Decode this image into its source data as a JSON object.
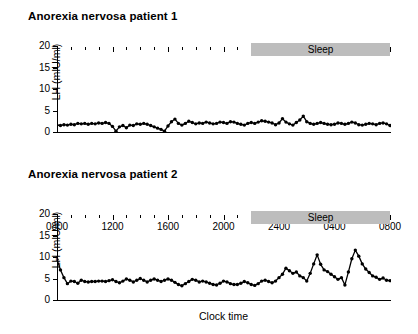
{
  "figure": {
    "x_axis_title": "Clock time",
    "y_axis_title": "LH (mIU/ml)",
    "sleep_label": "Sleep"
  },
  "panels": [
    {
      "title": "Anorexia nervosa patient 1"
    },
    {
      "title": "Anorexia nervosa patient 2"
    }
  ],
  "chart_data": {
    "type": "line",
    "xlabel": "Clock time",
    "ylabel": "LH (mIU/ml)",
    "ylim": [
      0,
      20
    ],
    "yticks": [
      0,
      5,
      10,
      15,
      20
    ],
    "ytick_labels": [
      "0",
      "5",
      "10",
      "15",
      "20"
    ],
    "xlim_hours": [
      8,
      32
    ],
    "xtick_labels": [
      "0800",
      "1200",
      "1600",
      "2000",
      "2400",
      "0400",
      "0800"
    ],
    "xtick_hours": [
      8,
      12,
      16,
      20,
      24,
      28,
      32
    ],
    "minor_tick_interval_hours": 1,
    "grid": false,
    "legend": false,
    "annotations": [
      {
        "text": "Sleep",
        "type": "span-bar",
        "start_hour": 22,
        "end_hour": 32,
        "color": "#bdbdbd",
        "panels": [
          0,
          1
        ]
      }
    ],
    "marker": "filled-circle",
    "sampling_interval_minutes": 15,
    "series": [
      {
        "name": "Anorexia nervosa patient 1",
        "panel": 0,
        "x_hours": [
          8,
          8.25,
          8.5,
          8.75,
          9,
          9.25,
          9.5,
          9.75,
          10,
          10.25,
          10.5,
          10.75,
          11,
          11.25,
          11.5,
          11.75,
          12,
          12.25,
          12.5,
          12.75,
          13,
          13.25,
          13.5,
          13.75,
          14,
          14.25,
          14.5,
          14.75,
          15,
          15.25,
          15.5,
          15.75,
          16,
          16.25,
          16.5,
          16.75,
          17,
          17.25,
          17.5,
          17.75,
          18,
          18.25,
          18.5,
          18.75,
          19,
          19.25,
          19.5,
          19.75,
          20,
          20.25,
          20.5,
          20.75,
          21,
          21.25,
          21.5,
          21.75,
          22,
          22.25,
          22.5,
          22.75,
          23,
          23.25,
          23.5,
          23.75,
          24,
          24.25,
          24.5,
          24.75,
          25,
          25.25,
          25.5,
          25.75,
          26,
          26.25,
          26.5,
          26.75,
          27,
          27.25,
          27.5,
          27.75,
          28,
          28.25,
          28.5,
          28.75,
          29,
          29.25,
          29.5,
          29.75,
          30,
          30.25,
          30.5,
          30.75,
          31,
          31.25,
          31.5,
          31.75,
          32
        ],
        "values": [
          1.6,
          1.5,
          1.7,
          1.6,
          1.8,
          1.7,
          2.0,
          1.9,
          2.0,
          1.8,
          2.0,
          1.9,
          2.1,
          2.0,
          2.2,
          2.0,
          1.3,
          0.2,
          1.2,
          1.5,
          1.0,
          1.6,
          1.5,
          1.9,
          1.8,
          2.0,
          1.8,
          1.5,
          1.2,
          0.9,
          0.6,
          0.2,
          1.4,
          2.4,
          3.0,
          2.0,
          1.6,
          2.0,
          2.5,
          2.2,
          1.9,
          2.1,
          2.0,
          2.3,
          2.1,
          1.9,
          2.0,
          2.3,
          2.2,
          2.0,
          2.4,
          2.3,
          2.0,
          1.8,
          1.6,
          2.0,
          2.2,
          2.0,
          2.3,
          2.6,
          2.5,
          2.3,
          2.1,
          1.7,
          2.1,
          3.1,
          2.3,
          1.9,
          1.6,
          2.2,
          2.8,
          3.7,
          2.4,
          2.0,
          1.8,
          2.0,
          2.2,
          2.0,
          1.8,
          1.7,
          1.8,
          2.1,
          2.0,
          1.8,
          2.0,
          2.3,
          2.1,
          1.7,
          1.6,
          1.8,
          2.0,
          1.9,
          1.7,
          2.0,
          2.1,
          1.9,
          1.5,
          1.2,
          2.0
        ]
      },
      {
        "name": "Anorexia nervosa patient 2",
        "panel": 1,
        "x_hours": [
          8,
          8.25,
          8.5,
          8.75,
          9,
          9.25,
          9.5,
          9.75,
          10,
          10.25,
          10.5,
          10.75,
          11,
          11.25,
          11.5,
          11.75,
          12,
          12.25,
          12.5,
          12.75,
          13,
          13.25,
          13.5,
          13.75,
          14,
          14.25,
          14.5,
          14.75,
          15,
          15.25,
          15.5,
          15.75,
          16,
          16.25,
          16.5,
          16.75,
          17,
          17.25,
          17.5,
          17.75,
          18,
          18.25,
          18.5,
          18.75,
          19,
          19.25,
          19.5,
          19.75,
          20,
          20.25,
          20.5,
          20.75,
          21,
          21.25,
          21.5,
          21.75,
          22,
          22.25,
          22.5,
          22.75,
          23,
          23.25,
          23.5,
          23.75,
          24,
          24.25,
          24.5,
          24.75,
          25,
          25.25,
          25.5,
          25.75,
          26,
          26.25,
          26.5,
          26.75,
          27,
          27.25,
          27.5,
          27.75,
          28,
          28.25,
          28.5,
          28.75,
          29,
          29.25,
          29.5,
          29.75,
          30,
          30.25,
          30.5,
          30.75,
          31,
          31.25,
          31.5,
          31.75,
          32
        ],
        "values": [
          9.4,
          7.0,
          5.2,
          3.8,
          4.4,
          4.3,
          3.9,
          4.6,
          4.3,
          4.2,
          4.3,
          4.3,
          4.4,
          4.4,
          4.3,
          4.5,
          4.7,
          4.3,
          4.0,
          4.4,
          4.9,
          4.6,
          4.2,
          4.6,
          5.0,
          4.6,
          4.2,
          4.6,
          4.9,
          4.6,
          4.3,
          4.6,
          4.9,
          4.6,
          4.1,
          3.6,
          3.3,
          3.8,
          4.3,
          4.8,
          4.6,
          4.2,
          4.4,
          4.2,
          3.9,
          3.6,
          3.5,
          3.9,
          4.4,
          4.2,
          3.8,
          3.6,
          3.6,
          3.9,
          4.3,
          4.0,
          3.6,
          3.4,
          3.8,
          4.4,
          4.6,
          4.3,
          4.0,
          4.4,
          5.2,
          6.0,
          7.4,
          6.8,
          6.2,
          6.5,
          5.6,
          5.2,
          4.4,
          6.2,
          8.4,
          10.5,
          8.3,
          7.0,
          6.6,
          6.0,
          5.4,
          4.8,
          5.2,
          3.5,
          6.5,
          9.6,
          11.6,
          10.2,
          8.4,
          7.2,
          6.4,
          5.6,
          5.3,
          4.8,
          5.1,
          4.6,
          4.5
        ]
      }
    ]
  }
}
